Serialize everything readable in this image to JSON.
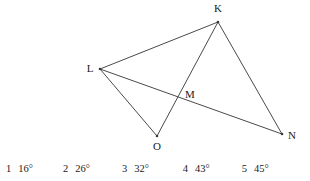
{
  "figure": {
    "stroke_color": "#4a4a4a",
    "background_color": "#ffffff",
    "vertices": [
      {
        "id": "K",
        "label": "K",
        "x": 218,
        "y": 22,
        "label_x": 218,
        "label_y": 12
      },
      {
        "id": "L",
        "label": "L",
        "x": 100,
        "y": 69,
        "label_x": 90,
        "label_y": 72
      },
      {
        "id": "M",
        "label": "M",
        "x": 180,
        "y": 95,
        "label_x": 190,
        "label_y": 98
      },
      {
        "id": "O",
        "label": "O",
        "x": 157,
        "y": 136,
        "label_x": 157,
        "label_y": 150
      },
      {
        "id": "N",
        "label": "N",
        "x": 282,
        "y": 134,
        "label_x": 292,
        "label_y": 139
      }
    ],
    "segments": [
      {
        "name": "segment-L-K",
        "from": "L",
        "to": "K"
      },
      {
        "name": "segment-L-N",
        "from": "L",
        "to": "N"
      },
      {
        "name": "segment-L-O",
        "from": "L",
        "to": "O"
      },
      {
        "name": "segment-K-O",
        "from": "K",
        "to": "O"
      },
      {
        "name": "segment-K-N",
        "from": "K",
        "to": "N"
      }
    ]
  },
  "answers": {
    "options": [
      {
        "number": "1",
        "value": "16°"
      },
      {
        "number": "2",
        "value": "26°"
      },
      {
        "number": "3",
        "value": "32°"
      },
      {
        "number": "4",
        "value": "43°"
      },
      {
        "number": "5",
        "value": "45°"
      }
    ]
  }
}
